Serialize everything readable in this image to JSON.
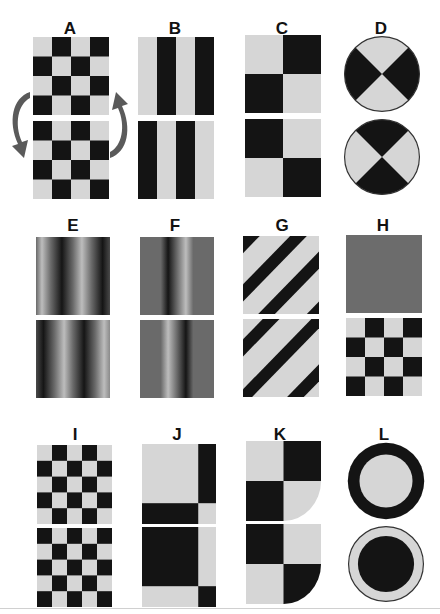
{
  "colors": {
    "dark": "#141414",
    "light": "#d6d6d6",
    "mid": "#6a6a6a",
    "arrow": "#5a5a5a",
    "bg": "#ffffff"
  },
  "figure": {
    "panels": [
      {
        "id": "A",
        "label": "A",
        "top": "checkerboard 4x4 phase 0",
        "bottom": "checkerboard 4x4 phase 1",
        "note": "curved arrows indicate swap"
      },
      {
        "id": "B",
        "label": "B",
        "top": "vertical bars (light-dark-light-dark)",
        "bottom": "vertical bars (dark-light-dark-light)"
      },
      {
        "id": "C",
        "label": "C",
        "top": "2x2 checker (light TL)",
        "bottom": "2x2 checker (dark TL)"
      },
      {
        "id": "D",
        "label": "D",
        "top": "bowtie disk (dark left/right)",
        "bottom": "bowtie disk (dark top/bottom)"
      },
      {
        "id": "E",
        "label": "E",
        "top": "sinusoidal grating phase 0",
        "bottom": "sinusoidal grating phase 180"
      },
      {
        "id": "F",
        "label": "F",
        "top": "single dark-light bar on gray",
        "bottom": "single light-dark bar on gray"
      },
      {
        "id": "G",
        "label": "G",
        "top": "diagonal stripes phase 0",
        "bottom": "diagonal stripes phase 180"
      },
      {
        "id": "H",
        "label": "H",
        "top": "uniform gray",
        "bottom": "checkerboard 4x4"
      },
      {
        "id": "I",
        "label": "I",
        "top": "checkerboard 5x5",
        "bottom": "checkerboard 5x5 inverted"
      },
      {
        "id": "J",
        "label": "J",
        "top": "light field with dark right bar and dark bottom bar",
        "bottom": "dark field with light right bar and light bottom bar"
      },
      {
        "id": "K",
        "label": "K",
        "top": "2x2 checker with rounded bottom-right",
        "bottom": "inverted 2x2 checker with rounded bottom-right"
      },
      {
        "id": "L",
        "label": "L",
        "top": "dark ring with light center",
        "bottom": "light ring with dark center"
      }
    ]
  }
}
